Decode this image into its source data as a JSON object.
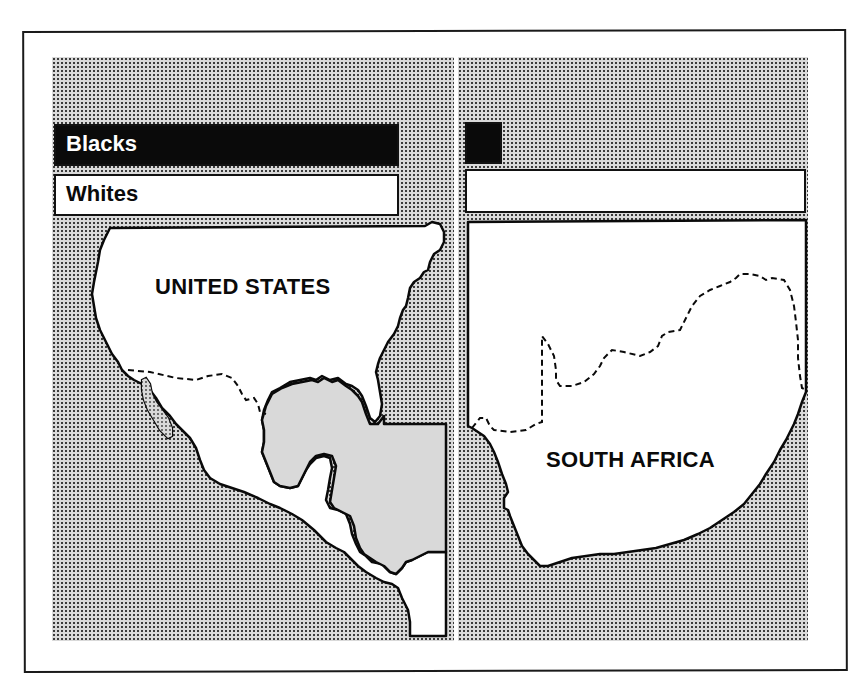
{
  "figure": {
    "panels": [
      {
        "id": "united-states",
        "country_label": "UNITED STATES",
        "legend": [
          {
            "label": "Blacks",
            "fill": "#0a0a0a",
            "text_color": "#ffffff",
            "relative_length": 1.0
          },
          {
            "label": "Whites",
            "fill": "#ffffff",
            "text_color": "#0a0a0a",
            "relative_length": 1.0
          }
        ]
      },
      {
        "id": "south-africa",
        "country_label": "SOUTH AFRICA",
        "legend": [
          {
            "label": "",
            "fill": "#0a0a0a",
            "relative_length": 0.11
          },
          {
            "label": "",
            "fill": "#ffffff",
            "relative_length": 1.0
          }
        ]
      }
    ],
    "colors": {
      "ink": "#0a0a0a",
      "paper": "#ffffff",
      "stipple_background": "#d9d9d9"
    }
  }
}
